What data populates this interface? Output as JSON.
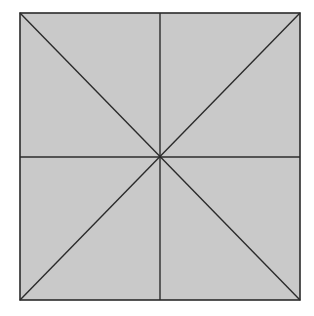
{
  "diagram": {
    "type": "square-divided-into-eight-triangles",
    "square": {
      "x": 20,
      "y": 13,
      "width": 280,
      "height": 287
    },
    "center": {
      "x": 160,
      "y": 157
    },
    "colors": {
      "fill": "#c9c9c9",
      "stroke": "#2b2b2b",
      "background": "#ffffff"
    },
    "lines": [
      "vertical-midline",
      "horizontal-midline",
      "diagonal-tl-br",
      "diagonal-tr-bl"
    ],
    "regions": 8
  }
}
